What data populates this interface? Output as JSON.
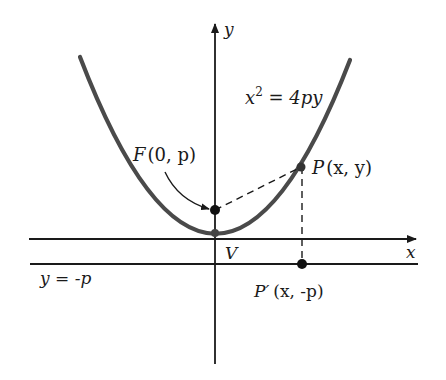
{
  "diagram": {
    "colors": {
      "background": "#ffffff",
      "axes": "#1a1a1a",
      "parabola": "#4a4a4a",
      "points": "#111111"
    },
    "axes": {
      "x_label": "x",
      "y_label": "y",
      "origin_px": [
        215,
        239
      ]
    },
    "curve": {
      "equation_lhs": "x",
      "equation_exp": "2",
      "equation_rhs": " = 4py",
      "equation_full": "x^2 = 4py"
    },
    "directrix": {
      "label": "y = -p"
    },
    "points": {
      "focus": {
        "label_letter": "F",
        "label_coords": "(0, p)",
        "px": [
          215,
          210
        ]
      },
      "vertex": {
        "label": "V",
        "px": [
          215,
          233
        ]
      },
      "P": {
        "label_letter": "P",
        "label_coords": "(x, y)",
        "px": [
          301,
          167
        ]
      },
      "P_prime": {
        "label_letter": "P′",
        "label_coords": "(x, -p)",
        "px": [
          302,
          264
        ]
      }
    },
    "segments": [
      {
        "from": "F",
        "to": "P",
        "style": "dashed"
      },
      {
        "from": "P",
        "to": "P_prime",
        "style": "dashed"
      }
    ]
  }
}
